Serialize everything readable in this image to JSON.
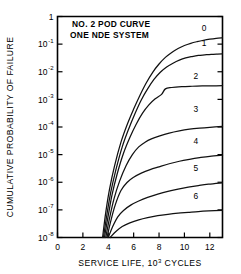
{
  "chart_data": {
    "type": "line",
    "title": "NO. 2 POD CURVE",
    "subtitle": "ONE NDE SYSTEM",
    "xlabel_prefix": "SERVICE LIFE, 10",
    "xlabel_exp": "3",
    "xlabel_suffix": " CYCLES",
    "ylabel": "CUMULATIVE PROBABILITY OF FAILURE",
    "xlim": [
      0,
      13
    ],
    "ylim_log10": [
      -8,
      0
    ],
    "grid": false,
    "legend": "inline-curve-labels",
    "x_ticks": [
      0,
      2,
      4,
      6,
      8,
      10,
      12
    ],
    "x_tick_labels": [
      "0",
      "2",
      "4",
      "6",
      "8",
      "10",
      "12"
    ],
    "y_ticks_log10": [
      0,
      -1,
      -2,
      -3,
      -4,
      -5,
      -6,
      -7,
      -8
    ],
    "y_tick_labels": [
      "1",
      "10",
      "10",
      "10",
      "10",
      "10",
      "10",
      "10",
      "10"
    ],
    "y_tick_exponents": [
      "",
      "-1",
      "-2",
      "-3",
      "-4",
      "-5",
      "-6",
      "-7",
      "-8"
    ],
    "series": [
      {
        "name": "0",
        "label": "0",
        "label_x": 11.55,
        "label_y_log10": -0.52,
        "points_x": [
          3.55,
          3.8,
          4.1,
          4.5,
          5.0,
          5.5,
          6.0,
          6.5,
          7.0,
          7.5,
          8.0,
          8.5,
          9.0,
          9.5,
          10.0,
          10.5,
          11.0,
          11.5,
          12.0,
          12.5,
          13.0
        ],
        "points_y_log10": [
          -8.0,
          -7.1,
          -6.25,
          -5.4,
          -4.55,
          -3.9,
          -3.35,
          -2.85,
          -2.4,
          -2.02,
          -1.72,
          -1.48,
          -1.3,
          -1.16,
          -1.05,
          -0.97,
          -0.91,
          -0.86,
          -0.82,
          -0.79,
          -0.77
        ]
      },
      {
        "name": "1",
        "label": "1",
        "label_x": 11.55,
        "label_y_log10": -1.05,
        "points_x": [
          3.62,
          3.9,
          4.2,
          4.6,
          5.1,
          5.6,
          6.1,
          6.6,
          7.1,
          7.6,
          8.1,
          8.6,
          9.1,
          9.6,
          10.1,
          10.6,
          11.1,
          11.6,
          12.1,
          12.6,
          13.0
        ],
        "points_y_log10": [
          -8.0,
          -7.15,
          -6.35,
          -5.55,
          -4.72,
          -4.08,
          -3.52,
          -3.02,
          -2.62,
          -2.28,
          -2.02,
          -1.83,
          -1.69,
          -1.58,
          -1.5,
          -1.45,
          -1.41,
          -1.39,
          -1.37,
          -1.36,
          -1.355
        ]
      },
      {
        "name": "2",
        "label": "2",
        "label_x": 10.9,
        "label_y_log10": -2.25,
        "points_x": [
          3.7,
          4.0,
          4.3,
          4.7,
          5.2,
          5.7,
          6.2,
          6.7,
          7.2,
          7.7,
          8.2,
          8.5,
          9.0,
          9.8,
          10.6,
          11.4,
          12.2,
          13.0
        ],
        "points_y_log10": [
          -8.0,
          -7.2,
          -6.45,
          -5.7,
          -4.95,
          -4.38,
          -3.9,
          -3.5,
          -3.2,
          -2.98,
          -2.82,
          -2.62,
          -2.57,
          -2.54,
          -2.525,
          -2.515,
          -2.51,
          -2.505
        ]
      },
      {
        "name": "3",
        "label": "3",
        "label_x": 10.9,
        "label_y_log10": -3.45,
        "points_x": [
          3.8,
          4.1,
          4.45,
          4.9,
          5.4,
          5.9,
          6.4,
          6.9,
          7.4,
          8.0,
          8.8,
          9.6,
          10.4,
          11.2,
          12.0,
          13.0
        ],
        "points_y_log10": [
          -8.0,
          -7.3,
          -6.6,
          -5.95,
          -5.4,
          -5.0,
          -4.72,
          -4.55,
          -4.43,
          -4.33,
          -4.22,
          -4.14,
          -4.08,
          -4.04,
          -4.01,
          -3.98
        ]
      },
      {
        "name": "4",
        "label": "4",
        "label_x": 10.9,
        "label_y_log10": -4.62,
        "points_x": [
          3.9,
          4.2,
          4.55,
          5.0,
          5.5,
          6.0,
          6.6,
          7.3,
          8.0,
          8.8,
          9.6,
          10.4,
          11.2,
          12.0,
          13.0
        ],
        "points_y_log10": [
          -8.0,
          -7.4,
          -6.82,
          -6.3,
          -6.0,
          -5.82,
          -5.67,
          -5.54,
          -5.44,
          -5.33,
          -5.24,
          -5.17,
          -5.11,
          -5.06,
          -5.02
        ]
      },
      {
        "name": "5",
        "label": "5",
        "label_x": 10.9,
        "label_y_log10": -5.58,
        "points_x": [
          4.0,
          4.35,
          4.75,
          5.2,
          5.8,
          6.4,
          7.1,
          7.9,
          8.7,
          9.5,
          10.3,
          11.1,
          11.9,
          13.0
        ],
        "points_y_log10": [
          -8.0,
          -7.6,
          -7.25,
          -7.02,
          -6.82,
          -6.68,
          -6.55,
          -6.43,
          -6.33,
          -6.25,
          -6.18,
          -6.12,
          -6.07,
          -6.02
        ]
      },
      {
        "name": "6",
        "label": "6",
        "label_x": 10.9,
        "label_y_log10": -6.62,
        "points_x": [
          4.15,
          4.6,
          5.1,
          5.7,
          6.4,
          7.1,
          7.9,
          8.7,
          9.5,
          10.3,
          11.1,
          11.9,
          13.0
        ],
        "points_y_log10": [
          -8.0,
          -7.78,
          -7.6,
          -7.47,
          -7.36,
          -7.28,
          -7.21,
          -7.16,
          -7.12,
          -7.09,
          -7.06,
          -7.04,
          -7.02
        ]
      }
    ]
  }
}
